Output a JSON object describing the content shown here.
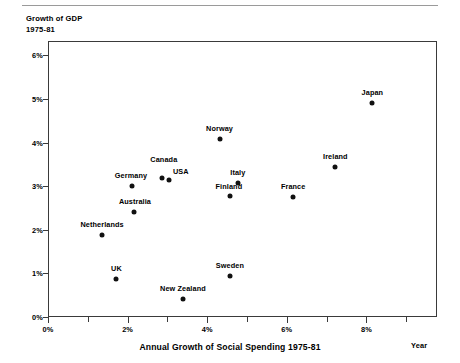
{
  "chart_data": {
    "type": "scatter",
    "title": "Annual Growth of Social Spending 1975-81",
    "ylabel_line1": "Growth of GDP",
    "ylabel_line2": "1975-81",
    "xlabel": "Year",
    "xlim": [
      0,
      9.75
    ],
    "ylim": [
      0,
      6.35
    ],
    "grid": false,
    "legend": "none",
    "xtick_labels": [
      "0%",
      "2%",
      "4%",
      "6%",
      "8%"
    ],
    "xtick_values": [
      0,
      2,
      4,
      6,
      8
    ],
    "xtick_minor_values": [
      1,
      3,
      5,
      7,
      9
    ],
    "ytick_labels": [
      "0%",
      "1%",
      "2%",
      "3%",
      "4%",
      "5%",
      "6%"
    ],
    "ytick_values": [
      0,
      1,
      2,
      3,
      4,
      5,
      6
    ],
    "points": [
      {
        "name": "UK",
        "x": 1.72,
        "y": 0.88,
        "label_pos": "c",
        "label_dx": 0,
        "label_dy": -11
      },
      {
        "name": "Netherlands",
        "x": 1.36,
        "y": 1.87,
        "label_pos": "c",
        "label_dx": 0,
        "label_dy": -11
      },
      {
        "name": "Germany",
        "x": 2.11,
        "y": 3.01,
        "label_pos": "c",
        "label_dx": -1,
        "label_dy": -11
      },
      {
        "name": "Australia",
        "x": 2.16,
        "y": 2.41,
        "label_pos": "c",
        "label_dx": 1,
        "label_dy": -11
      },
      {
        "name": "Canada",
        "x": 2.86,
        "y": 3.19,
        "label_pos": "c",
        "label_dx": 2,
        "label_dy": -19
      },
      {
        "name": "USA",
        "x": 3.04,
        "y": 3.15,
        "label_pos": "r",
        "label_dx": 4,
        "label_dy": -9
      },
      {
        "name": "New Zealand",
        "x": 3.39,
        "y": 0.41,
        "label_pos": "c",
        "label_dx": 0,
        "label_dy": -11
      },
      {
        "name": "Norway",
        "x": 4.31,
        "y": 4.08,
        "label_pos": "c",
        "label_dx": 0,
        "label_dy": -11
      },
      {
        "name": "Finland",
        "x": 4.57,
        "y": 2.78,
        "label_pos": "c",
        "label_dx": -1,
        "label_dy": -10
      },
      {
        "name": "Italy",
        "x": 4.77,
        "y": 3.08,
        "label_pos": "c",
        "label_dx": 0,
        "label_dy": -11
      },
      {
        "name": "Sweden",
        "x": 4.57,
        "y": 0.94,
        "label_pos": "c",
        "label_dx": 0,
        "label_dy": -11
      },
      {
        "name": "France",
        "x": 6.16,
        "y": 2.76,
        "label_pos": "c",
        "label_dx": 0,
        "label_dy": -11
      },
      {
        "name": "Ireland",
        "x": 7.22,
        "y": 3.45,
        "label_pos": "c",
        "label_dx": 0,
        "label_dy": -11
      },
      {
        "name": "Japan",
        "x": 8.15,
        "y": 4.9,
        "label_pos": "c",
        "label_dx": 0,
        "label_dy": -11
      }
    ]
  }
}
